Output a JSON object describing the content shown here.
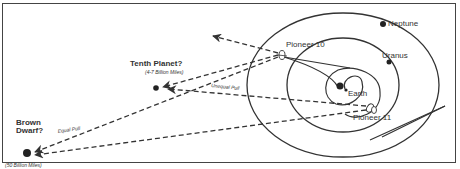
{
  "diagram": {
    "bodies": {
      "neptune": "Neptune",
      "uranus": "Uranus",
      "earth": "Earth",
      "pioneer10": "Pioneer 10",
      "pioneer11": "Pioneer 11"
    },
    "hypotheses": {
      "tenth_planet": {
        "title": "Tenth Planet?",
        "distance": "(4-7 Billion Miles)"
      },
      "brown_dwarf": {
        "title_line1": "Brown",
        "title_line2": "Dwarf?",
        "distance": "(50 Billion Miles)"
      }
    },
    "forces": {
      "unequal_pull": "Unequal Pull",
      "equal_pull": "Equal Pull"
    },
    "colors": {
      "line": "#333333",
      "border": "#444444",
      "background": "#ffffff"
    }
  }
}
